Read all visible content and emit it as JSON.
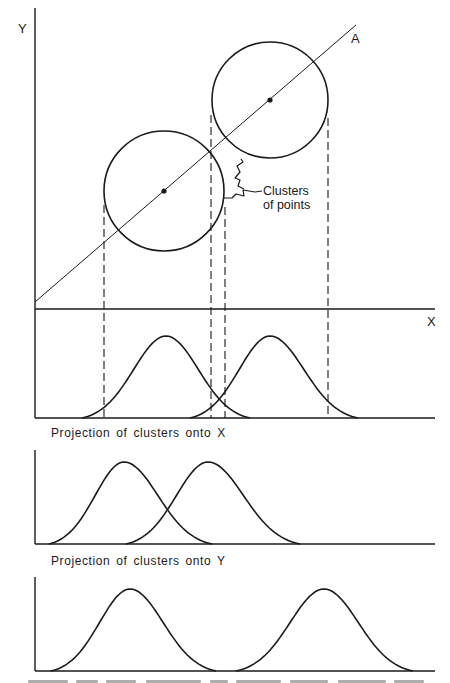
{
  "figure": {
    "stroke_color": "#1a1a1a",
    "background": "#ffffff",
    "scatter_panel": {
      "y_axis_label": "Y",
      "x_axis_label": "X",
      "line_label": "A",
      "annotation": "Clusters\nof points",
      "y_axis": {
        "x": 35,
        "y1": 8,
        "y2": 418
      },
      "x_axis": {
        "y": 309,
        "x1": 35,
        "x2": 435
      },
      "line_a": {
        "x1": 35,
        "y1": 302,
        "x2": 356,
        "y2": 25
      },
      "clusters": [
        {
          "name": "cluster-1",
          "cx": 164,
          "cy": 191,
          "r": 60
        },
        {
          "name": "cluster-2",
          "cx": 270,
          "cy": 100,
          "r": 58
        }
      ],
      "dashed_projections": [
        {
          "x": 104,
          "y1": 205,
          "y2": 418
        },
        {
          "x": 211,
          "y1": 115,
          "y2": 418
        },
        {
          "x": 225,
          "y1": 207,
          "y2": 418
        },
        {
          "x": 328,
          "y1": 118,
          "y2": 418
        }
      ]
    },
    "projection_panels": [
      {
        "name": "projection-onto-line-a",
        "label": "",
        "axis_top": 309,
        "baseline": 418,
        "x_left": 35,
        "x_right": 435,
        "curves": [
          {
            "x0": 82,
            "peak_x": 166,
            "x1": 250,
            "peak_y": 336
          },
          {
            "x0": 190,
            "peak_x": 270,
            "x1": 358,
            "peak_y": 336
          }
        ]
      },
      {
        "name": "projection-onto-x",
        "label": "Projection of clusters onto X",
        "label_pos": {
          "x": 51,
          "y": 427
        },
        "axis_top": 450,
        "baseline": 544,
        "x_left": 35,
        "x_right": 435,
        "curves": [
          {
            "x0": 49,
            "peak_x": 124,
            "x1": 212,
            "peak_y": 462
          },
          {
            "x0": 126,
            "peak_x": 208,
            "x1": 300,
            "peak_y": 462
          }
        ]
      },
      {
        "name": "projection-onto-y",
        "label": "Projection of clusters onto Y",
        "label_pos": {
          "x": 51,
          "y": 555
        },
        "axis_top": 577,
        "baseline": 671,
        "x_left": 35,
        "x_right": 435,
        "curves": [
          {
            "x0": 51,
            "peak_x": 130,
            "x1": 216,
            "peak_y": 589
          },
          {
            "x0": 236,
            "peak_x": 324,
            "x1": 413,
            "peak_y": 589
          }
        ]
      }
    ],
    "caption_truncated": true
  }
}
